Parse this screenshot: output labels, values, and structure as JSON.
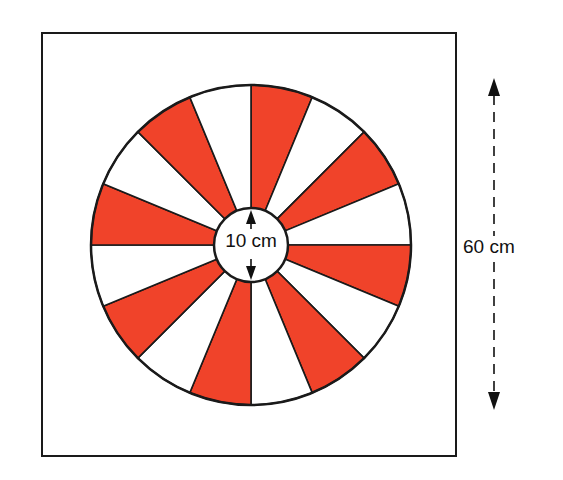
{
  "diagram": {
    "type": "spinner-wheel",
    "square": {
      "side_label": "60 cm"
    },
    "wheel": {
      "sectors": 16,
      "sector_angle_deg": 22.5,
      "pattern": [
        "red",
        "white"
      ],
      "colors": {
        "red": "#f0432a",
        "white": "#ffffff",
        "outline": "#1a1a1a"
      }
    },
    "inner_circle": {
      "diameter_label": "10 cm"
    },
    "labels": {
      "inner_diameter": "10 cm",
      "square_height": "60 cm"
    }
  }
}
